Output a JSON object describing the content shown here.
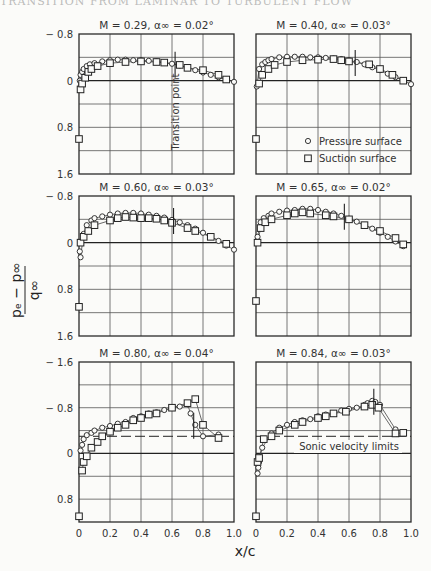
{
  "header": {
    "cropped_running_head": "TRANSITION FROM LAMINAR TO TURBULENT FLOW"
  },
  "figure": {
    "y_axis_label": "(pₑ − p∞) / q∞",
    "y_numerator": "pₑ − p∞",
    "y_denominator": "q∞",
    "x_axis_label": "x/c",
    "legend": {
      "pressure": "Pressure surface",
      "suction": "Suction surface"
    },
    "annotations": {
      "transition": "Transition point",
      "sonic": "Sonic velocity limits"
    },
    "x_ticks": [
      "0",
      "0.2",
      "0.4",
      "0.6",
      "0.8",
      "1.0"
    ],
    "y_ticks_upper": [
      "− 0.8",
      "0",
      "0.8",
      "1.6"
    ],
    "y_ticks_lower": [
      "− 1.6",
      "− 0.8",
      "0",
      "0.8"
    ]
  },
  "chart_data": [
    {
      "type": "scatter",
      "title": "M = 0.29, α∞ = 0.02°",
      "xlabel": "x/c",
      "ylabel": "(pe − p∞)/q∞",
      "xlim": [
        0,
        1.0
      ],
      "ylim": [
        1.6,
        -0.8
      ],
      "grid": true,
      "transition_x": 0.62,
      "series": [
        {
          "name": "Pressure surface",
          "marker": "circle",
          "x": [
            0.005,
            0.01,
            0.02,
            0.03,
            0.05,
            0.07,
            0.1,
            0.15,
            0.2,
            0.25,
            0.3,
            0.35,
            0.4,
            0.45,
            0.5,
            0.55,
            0.6,
            0.65,
            0.7,
            0.75,
            0.8,
            0.85,
            0.9,
            0.95,
            1.0
          ],
          "y": [
            0.0,
            -0.1,
            -0.15,
            -0.2,
            -0.25,
            -0.28,
            -0.3,
            -0.33,
            -0.35,
            -0.36,
            -0.36,
            -0.35,
            -0.35,
            -0.34,
            -0.33,
            -0.31,
            -0.29,
            -0.26,
            -0.22,
            -0.18,
            -0.14,
            -0.1,
            -0.06,
            -0.02,
            0.02
          ]
        },
        {
          "name": "Suction surface",
          "marker": "square",
          "x": [
            0.0,
            0.01,
            0.02,
            0.04,
            0.06,
            0.08,
            0.12,
            0.2,
            0.3,
            0.4,
            0.5,
            0.55,
            0.65,
            0.7,
            0.8,
            0.9,
            0.95
          ],
          "y": [
            1.0,
            0.15,
            0.05,
            -0.05,
            -0.15,
            -0.2,
            -0.25,
            -0.3,
            -0.32,
            -0.33,
            -0.32,
            -0.31,
            -0.27,
            -0.22,
            -0.18,
            -0.1,
            -0.02
          ]
        }
      ]
    },
    {
      "type": "scatter",
      "title": "M = 0.40, α∞ = 0.03°",
      "xlabel": "x/c",
      "ylabel": "(pe − p∞)/q∞",
      "xlim": [
        0,
        1.0
      ],
      "ylim": [
        1.6,
        -0.8
      ],
      "grid": true,
      "transition_x": 0.64,
      "series": [
        {
          "name": "Pressure surface",
          "marker": "circle",
          "x": [
            0.005,
            0.02,
            0.04,
            0.06,
            0.08,
            0.1,
            0.15,
            0.2,
            0.25,
            0.3,
            0.35,
            0.4,
            0.45,
            0.5,
            0.55,
            0.6,
            0.65,
            0.7,
            0.75,
            0.8,
            0.85,
            0.9,
            0.95,
            1.0
          ],
          "y": [
            0.1,
            -0.2,
            -0.28,
            -0.32,
            -0.35,
            -0.37,
            -0.4,
            -0.41,
            -0.41,
            -0.41,
            -0.4,
            -0.4,
            -0.39,
            -0.38,
            -0.37,
            -0.35,
            -0.32,
            -0.28,
            -0.23,
            -0.18,
            -0.12,
            -0.06,
            0.0,
            0.06
          ]
        },
        {
          "name": "Suction surface",
          "marker": "square",
          "x": [
            0.0,
            0.02,
            0.04,
            0.08,
            0.12,
            0.2,
            0.3,
            0.4,
            0.5,
            0.55,
            0.6,
            0.73,
            0.8,
            0.88,
            0.95
          ],
          "y": [
            1.0,
            0.05,
            -0.1,
            -0.2,
            -0.27,
            -0.32,
            -0.35,
            -0.36,
            -0.37,
            -0.35,
            -0.33,
            -0.28,
            -0.2,
            -0.1,
            0.0
          ]
        }
      ]
    },
    {
      "type": "scatter",
      "title": "M = 0.60, α∞ = 0.03°",
      "xlabel": "x/c",
      "ylabel": "(pe − p∞)/q∞",
      "xlim": [
        0,
        1.0
      ],
      "ylim": [
        1.6,
        -0.8
      ],
      "grid": true,
      "transition_x": 0.61,
      "series": [
        {
          "name": "Pressure surface",
          "marker": "circle",
          "x": [
            0.005,
            0.01,
            0.03,
            0.05,
            0.08,
            0.1,
            0.15,
            0.2,
            0.25,
            0.3,
            0.35,
            0.4,
            0.45,
            0.5,
            0.55,
            0.6,
            0.65,
            0.7,
            0.75,
            0.8,
            0.85,
            0.9,
            0.95,
            1.0
          ],
          "y": [
            0.15,
            0.25,
            -0.15,
            -0.3,
            -0.38,
            -0.42,
            -0.45,
            -0.48,
            -0.5,
            -0.51,
            -0.51,
            -0.5,
            -0.48,
            -0.46,
            -0.43,
            -0.39,
            -0.35,
            -0.3,
            -0.24,
            -0.17,
            -0.1,
            -0.03,
            0.05,
            0.12
          ]
        },
        {
          "name": "Suction surface",
          "marker": "square",
          "x": [
            0.0,
            0.01,
            0.03,
            0.06,
            0.1,
            0.2,
            0.25,
            0.3,
            0.35,
            0.4,
            0.45,
            0.5,
            0.55,
            0.6,
            0.7,
            0.75,
            0.85,
            0.95
          ],
          "y": [
            1.1,
            0.0,
            -0.1,
            -0.2,
            -0.3,
            -0.38,
            -0.42,
            -0.44,
            -0.43,
            -0.42,
            -0.42,
            -0.41,
            -0.38,
            -0.34,
            -0.25,
            -0.2,
            -0.1,
            0.02
          ]
        }
      ]
    },
    {
      "type": "scatter",
      "title": "M = 0.65, α∞ = 0.02°",
      "xlabel": "x/c",
      "ylabel": "(pe − p∞)/q∞",
      "xlim": [
        0,
        1.0
      ],
      "ylim": [
        1.6,
        -0.8
      ],
      "grid": true,
      "transition_x": 0.57,
      "series": [
        {
          "name": "Pressure surface",
          "marker": "circle",
          "x": [
            0.01,
            0.03,
            0.05,
            0.08,
            0.1,
            0.15,
            0.2,
            0.25,
            0.3,
            0.35,
            0.4,
            0.45,
            0.5,
            0.55,
            0.6,
            0.65,
            0.7,
            0.75,
            0.8,
            0.85,
            0.9,
            0.95
          ],
          "y": [
            -0.1,
            -0.35,
            -0.42,
            -0.46,
            -0.5,
            -0.53,
            -0.55,
            -0.56,
            -0.58,
            -0.58,
            -0.56,
            -0.53,
            -0.5,
            -0.46,
            -0.41,
            -0.36,
            -0.3,
            -0.24,
            -0.17,
            -0.1,
            -0.02,
            0.06
          ]
        },
        {
          "name": "Suction surface",
          "marker": "square",
          "x": [
            0.0,
            0.01,
            0.03,
            0.06,
            0.1,
            0.2,
            0.25,
            0.3,
            0.35,
            0.45,
            0.5,
            0.6,
            0.7,
            0.8,
            0.9,
            0.95
          ],
          "y": [
            1.0,
            0.0,
            -0.25,
            -0.35,
            -0.4,
            -0.47,
            -0.5,
            -0.52,
            -0.5,
            -0.47,
            -0.45,
            -0.4,
            -0.3,
            -0.2,
            -0.08,
            0.03
          ]
        }
      ]
    },
    {
      "type": "scatter",
      "title": "M = 0.80, α∞ = 0.04°",
      "xlabel": "x/c",
      "ylabel": "(pe − p∞)/q∞",
      "xlim": [
        0,
        1.0
      ],
      "ylim": [
        1.2,
        -1.6
      ],
      "grid": true,
      "transition_x": 0.74,
      "sonic_line_y": -0.3,
      "series": [
        {
          "name": "Pressure surface",
          "marker": "circle",
          "x": [
            0.01,
            0.02,
            0.03,
            0.05,
            0.08,
            0.1,
            0.15,
            0.2,
            0.25,
            0.3,
            0.35,
            0.4,
            0.45,
            0.5,
            0.55,
            0.6,
            0.65,
            0.7,
            0.72,
            0.75,
            0.8,
            0.9
          ],
          "y": [
            -0.05,
            -0.15,
            -0.25,
            -0.32,
            -0.36,
            -0.4,
            -0.45,
            -0.48,
            -0.52,
            -0.55,
            -0.62,
            -0.65,
            -0.7,
            -0.72,
            -0.76,
            -0.8,
            -0.82,
            -0.86,
            -0.7,
            -0.5,
            -0.3,
            -0.33
          ]
        },
        {
          "name": "Suction surface",
          "marker": "square",
          "x": [
            0.0,
            0.02,
            0.03,
            0.05,
            0.08,
            0.12,
            0.15,
            0.2,
            0.25,
            0.3,
            0.35,
            0.4,
            0.45,
            0.5,
            0.6,
            0.7,
            0.75,
            0.8,
            0.9
          ],
          "y": [
            1.1,
            0.3,
            0.15,
            0.05,
            -0.1,
            -0.2,
            -0.3,
            -0.38,
            -0.45,
            -0.5,
            -0.58,
            -0.62,
            -0.68,
            -0.7,
            -0.8,
            -0.88,
            -0.95,
            -0.5,
            -0.27
          ]
        }
      ]
    },
    {
      "type": "scatter",
      "title": "M = 0.84, α∞ = 0.03°",
      "xlabel": "x/c",
      "ylabel": "(pe − p∞)/q∞",
      "xlim": [
        0,
        1.0
      ],
      "ylim": [
        1.2,
        -1.6
      ],
      "grid": true,
      "transition_x": 0.76,
      "sonic_line_y": -0.3,
      "series": [
        {
          "name": "Pressure surface",
          "marker": "circle",
          "x": [
            0.01,
            0.015,
            0.02,
            0.04,
            0.1,
            0.15,
            0.2,
            0.25,
            0.3,
            0.35,
            0.4,
            0.45,
            0.5,
            0.55,
            0.6,
            0.65,
            0.7,
            0.72,
            0.75,
            0.77,
            0.8,
            0.9
          ],
          "y": [
            0.35,
            0.25,
            0.15,
            -0.1,
            -0.35,
            -0.45,
            -0.5,
            -0.55,
            -0.58,
            -0.6,
            -0.65,
            -0.68,
            -0.7,
            -0.75,
            -0.78,
            -0.8,
            -0.85,
            -0.88,
            -0.92,
            -0.9,
            -0.85,
            -0.42
          ]
        },
        {
          "name": "Suction surface",
          "marker": "square",
          "x": [
            0.0,
            0.01,
            0.02,
            0.05,
            0.1,
            0.15,
            0.25,
            0.3,
            0.4,
            0.45,
            0.5,
            0.58,
            0.7,
            0.75,
            0.79,
            0.9,
            0.95
          ],
          "y": [
            1.1,
            0.15,
            0.08,
            -0.25,
            -0.3,
            -0.4,
            -0.5,
            -0.55,
            -0.62,
            -0.65,
            -0.7,
            -0.73,
            -0.82,
            -0.85,
            -0.8,
            -0.35,
            -0.36
          ]
        }
      ]
    }
  ]
}
